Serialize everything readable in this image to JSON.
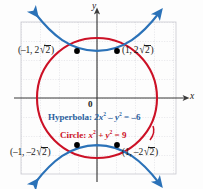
{
  "figure": {
    "type": "coordinate-graph",
    "axes": {
      "x_label": "x",
      "y_label": "y",
      "origin_label": "0"
    },
    "grid": {
      "visible": true,
      "style": "dotted",
      "color": "#c9c9cf",
      "spacing_px": 19
    },
    "curves": [
      {
        "name": "circle",
        "color": "#cc1126",
        "equation_text": "Circle: x2 + y2 = 9",
        "radius": 3,
        "center": [
          0,
          0
        ]
      },
      {
        "name": "hyperbola",
        "color": "#2b72b8",
        "equation_text": "Hyperbola: 2x2 - y2 = -6",
        "a2": 3,
        "b2": 6,
        "orientation": "vertical"
      }
    ],
    "intersection_points": [
      {
        "label_tl": "(-1, 2",
        "value": "(-1, 2√2)",
        "x": -1,
        "y": 2.8284
      },
      {
        "label_tr": "(1, 2",
        "value": "(1, 2√2)",
        "x": 1,
        "y": 2.8284
      },
      {
        "label_bl": "(-1, -2",
        "value": "(-1, -2√2)",
        "x": -1,
        "y": -2.8284
      },
      {
        "label_br": "(1, -2",
        "value": "(1, -2√2)",
        "x": 1,
        "y": -2.8284
      }
    ],
    "labels": {
      "top_left_pre": "(–1, 2",
      "top_left_post": ")",
      "top_right_pre": "(1, 2",
      "top_right_post": ")",
      "bottom_left_pre": "(–1, –2",
      "bottom_left_post": ")",
      "bottom_right_pre": "(1, –2",
      "bottom_right_post": ")",
      "radicand": "2",
      "radical_symbol": "√",
      "origin": "0",
      "x_axis": "x",
      "y_axis": "y"
    },
    "equations": {
      "hyperbola_name": "Hyperbola: ",
      "hyperbola_lhs_a": "2x",
      "hyperbola_exp_a": "2",
      "hyperbola_mid": " – y",
      "hyperbola_exp_b": "2",
      "hyperbola_rhs": " = –6",
      "circle_name": "Circle: ",
      "circle_lhs_a": "x",
      "circle_exp_a": "2",
      "circle_mid": " + y",
      "circle_exp_b": "2",
      "circle_rhs": " = 9"
    },
    "colors": {
      "circle": "#cc1126",
      "hyperbola": "#2b72b8",
      "axis": "#3a3a3a",
      "grid": "#c9c9cf",
      "point": "#000000",
      "text": "#1a1a1a"
    }
  }
}
